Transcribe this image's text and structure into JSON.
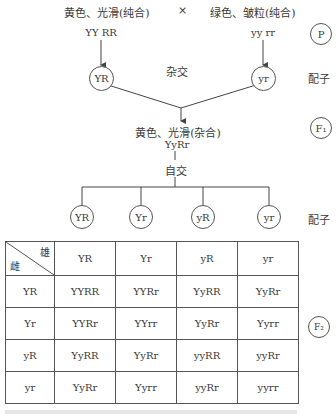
{
  "parents": {
    "left_phenotype": "黄色、光滑(纯合)",
    "cross_symbol": "×",
    "right_phenotype": "绿色、皱粒(纯合)",
    "left_genotype": "YY RR",
    "right_genotype": "yy rr",
    "left_gamete": "YR",
    "right_gamete": "yr",
    "cross_label": "杂交"
  },
  "f1": {
    "phenotype": "黄色、光滑(杂合)",
    "genotype": "YyRr",
    "self_cross_label": "自交",
    "gametes": [
      "YR",
      "Yr",
      "yR",
      "yr"
    ]
  },
  "side_labels": {
    "p": "P",
    "gamete1": "配子",
    "f1": "F₁",
    "gamete2": "配子",
    "f2": "F₂"
  },
  "punnett": {
    "corner_top": "雄",
    "corner_bottom": "雌",
    "col_headers": [
      "YR",
      "Yr",
      "yR",
      "yr"
    ],
    "rows": [
      {
        "header": "YR",
        "cells": [
          "YYRR",
          "YYRr",
          "YyRR",
          "YyRr"
        ]
      },
      {
        "header": "Yr",
        "cells": [
          "YYRr",
          "YYrr",
          "YyRr",
          "Yyrr"
        ]
      },
      {
        "header": "yR",
        "cells": [
          "YyRR",
          "YyRr",
          "yyRR",
          "yyRr"
        ]
      },
      {
        "header": "yr",
        "cells": [
          "YyRr",
          "Yyrr",
          "yyRr",
          "yyrr"
        ]
      }
    ]
  }
}
